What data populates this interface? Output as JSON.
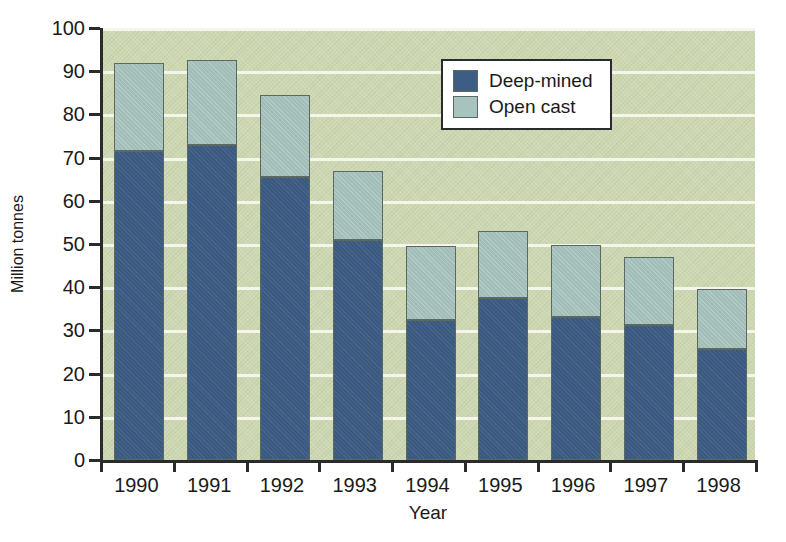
{
  "chart_data": {
    "type": "bar",
    "subtype": "stacked-bar",
    "title": "",
    "xlabel": "Year",
    "ylabel": "Million tonnes",
    "categories": [
      "1990",
      "1991",
      "1992",
      "1993",
      "1994",
      "1995",
      "1996",
      "1997",
      "1998"
    ],
    "series": [
      {
        "name": "Deep-mined",
        "color": "#3d5d85",
        "values": [
          71.5,
          73.0,
          65.5,
          51.0,
          32.5,
          37.5,
          33.0,
          31.3,
          25.8
        ]
      },
      {
        "name": "Open cast",
        "color": "#a7c3bd",
        "values": [
          20.5,
          19.5,
          19.0,
          16.0,
          17.0,
          15.5,
          16.8,
          15.7,
          13.7
        ]
      }
    ],
    "totals": [
      92.0,
      92.5,
      84.5,
      67.0,
      49.5,
      53.0,
      49.8,
      47.0,
      39.5
    ],
    "ylim": [
      0,
      100
    ],
    "yticks": [
      0,
      10,
      20,
      30,
      40,
      50,
      60,
      70,
      80,
      90,
      100
    ],
    "ytick_labels": [
      "0",
      "10",
      "20",
      "30",
      "40",
      "50",
      "60",
      "70",
      "80",
      "90",
      "100"
    ],
    "grid": "horizontal",
    "gridline_color": "#f4f6ec",
    "plot_background": "#cdd8b2",
    "legend_position": "top-right",
    "legend_entries": [
      "Deep-mined",
      "Open cast"
    ]
  }
}
